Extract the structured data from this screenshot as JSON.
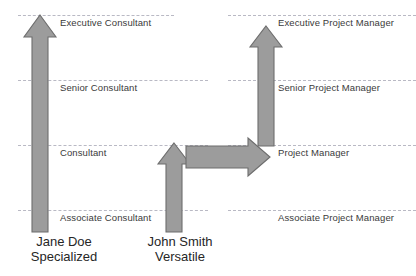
{
  "diagram": {
    "background_color": "#ffffff",
    "arrow_fill": "#9c9c9c",
    "arrow_stroke": "#6d6d6d",
    "gridline_color": "#b9b9c4",
    "label_color": "#3a3a3a",
    "person_label_color": "#262626"
  },
  "levels": [
    {
      "id": "executive",
      "y": 15,
      "consultant_label": "Executive Consultant",
      "manager_label": "Executive Project Manager",
      "consultant_label_x": 60,
      "manager_label_x": 278
    },
    {
      "id": "senior",
      "y": 80,
      "consultant_label": "Senior Consultant",
      "manager_label": "Senior Project Manager",
      "consultant_label_x": 60,
      "manager_label_x": 278
    },
    {
      "id": "mid",
      "y": 145,
      "consultant_label": "Consultant",
      "manager_label": "Project Manager",
      "consultant_label_x": 60,
      "manager_label_x": 278
    },
    {
      "id": "associate",
      "y": 210,
      "consultant_label": "Associate Consultant",
      "manager_label": "Associate Project Manager",
      "consultant_label_x": 60,
      "manager_label_x": 278
    }
  ],
  "gridlines": [
    {
      "id": "gridline-executive-left",
      "x": 18,
      "width": 156,
      "y": 15
    },
    {
      "id": "gridline-executive-right",
      "x": 228,
      "width": 188,
      "y": 15
    },
    {
      "id": "gridline-senior-left",
      "x": 18,
      "width": 190,
      "y": 80
    },
    {
      "id": "gridline-senior-right",
      "x": 228,
      "width": 188,
      "y": 80
    },
    {
      "id": "gridline-mid-left",
      "x": 18,
      "width": 190,
      "y": 145
    },
    {
      "id": "gridline-mid-right",
      "x": 228,
      "width": 188,
      "y": 145
    },
    {
      "id": "gridline-associate-left",
      "x": 18,
      "width": 190,
      "y": 210
    },
    {
      "id": "gridline-associate-right",
      "x": 228,
      "width": 188,
      "y": 210
    }
  ],
  "people": [
    {
      "id": "jane-doe",
      "name": "Jane Doe",
      "descriptor": "Specialized",
      "label_center_x": 64,
      "label_y": 234
    },
    {
      "id": "john-smith",
      "name": "John Smith",
      "descriptor": "Versatile",
      "label_center_x": 180,
      "label_y": 234
    }
  ],
  "arrows": [
    {
      "id": "jane-doe-path-arrow",
      "semantic": "vertical-up-arrow",
      "direction": "up",
      "from_level": "associate",
      "to_level": "executive",
      "shaft_left": 32,
      "shaft_right": 48,
      "head_left": 24,
      "head_right": 56,
      "head_base_y": 37,
      "tip_y": 15,
      "bottom_y": 232
    },
    {
      "id": "john-smith-consultant-arrow",
      "semantic": "vertical-up-arrow",
      "direction": "up",
      "from_level": "associate",
      "to_level": "mid",
      "shaft_left": 166,
      "shaft_right": 182,
      "head_left": 158,
      "head_right": 190,
      "head_base_y": 164,
      "tip_y": 143,
      "bottom_y": 232
    },
    {
      "id": "john-smith-transition-arrow",
      "semantic": "horizontal-right-arrow",
      "direction": "right",
      "from_level": "mid-consultant",
      "to_level": "mid-project-manager",
      "shaft_top": 146,
      "shaft_bottom": 168,
      "head_top": 138,
      "head_bottom": 176,
      "head_base_x": 248,
      "tip_x": 270,
      "left_x": 186
    },
    {
      "id": "john-smith-manager-arrow",
      "semantic": "vertical-up-arrow",
      "direction": "up",
      "from_level": "mid-project-manager",
      "to_level": "executive-project-manager",
      "shaft_left": 258,
      "shaft_right": 274,
      "head_left": 250,
      "head_right": 282,
      "head_base_y": 47,
      "tip_y": 26,
      "bottom_y": 146
    }
  ]
}
